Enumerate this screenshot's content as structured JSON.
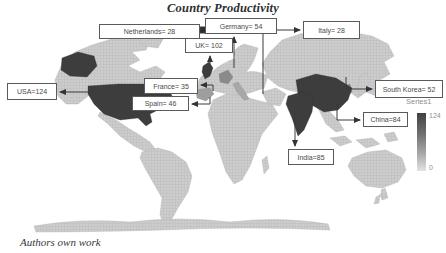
{
  "title": "Country Productivity",
  "caption": "Authors own work",
  "legend": {
    "series": "Series1",
    "max": "124",
    "min": "0"
  },
  "colors": {
    "value_dark": "#3d3d3d",
    "value_medium": "#8a8a8a",
    "land_light": "#cdcdcd",
    "ocean": "#ffffff",
    "box_border": "#5a5a5a",
    "arrow": "#3a3a3a"
  },
  "chart_data": {
    "type": "heatmap",
    "subtype": "world-choropleth-map",
    "title": "Country Productivity",
    "series_name": "Series1",
    "scale_min": 0,
    "scale_max": 124,
    "legend_position": "right",
    "countries": [
      "USA",
      "UK",
      "India",
      "China",
      "Germany",
      "South Korea",
      "Spain",
      "France",
      "Italy",
      "Netherlands"
    ],
    "values": [
      124,
      102,
      85,
      84,
      54,
      52,
      46,
      35,
      28,
      28
    ],
    "callouts": [
      {
        "id": "netherlands",
        "label": "Netherlands= 28",
        "box": [
          99,
          24,
          101,
          15
        ],
        "arrow": [
          [
            207,
            30
          ],
          [
            203,
            30
          ]
        ],
        "end": "square"
      },
      {
        "id": "germany",
        "label": "Germany= 54",
        "box": [
          205,
          18,
          72,
          16
        ],
        "arrow": [
          [
            234,
            68
          ],
          [
            234,
            37
          ]
        ],
        "end": "arrow"
      },
      {
        "id": "italy",
        "label": "Italy= 28",
        "box": [
          303,
          21,
          57,
          18
        ],
        "arrow": [
          [
            263,
            94
          ],
          [
            263,
            30
          ],
          [
            300,
            30
          ]
        ],
        "end": "arrow"
      },
      {
        "id": "uk",
        "label": "UK= 102",
        "box": [
          185,
          38,
          48,
          15
        ],
        "arrow": [
          [
            210,
            67
          ],
          [
            210,
            56
          ]
        ],
        "end": "arrow"
      },
      {
        "id": "usa",
        "label": "USA=124",
        "box": [
          7,
          83,
          50,
          17
        ],
        "arrow": [
          [
            96,
            92
          ],
          [
            60,
            92
          ]
        ],
        "end": "arrow"
      },
      {
        "id": "france",
        "label": "France= 35",
        "box": [
          144,
          78,
          54,
          16
        ],
        "arrow": [
          [
            213,
            91
          ],
          [
            213,
            85
          ],
          [
            201,
            85
          ]
        ],
        "end": "arrow"
      },
      {
        "id": "spain",
        "label": "Spain= 46",
        "box": [
          132,
          96,
          57,
          15
        ],
        "arrow": [
          [
            210,
            97
          ],
          [
            210,
            104
          ],
          [
            192,
            104
          ]
        ],
        "end": "arrow"
      },
      {
        "id": "south-korea",
        "label": "South Korea= 52",
        "box": [
          375,
          80,
          68,
          18
        ],
        "arrow": [
          [
            346,
            77
          ],
          [
            346,
            89
          ],
          [
            372,
            89
          ]
        ],
        "end": "arrow"
      },
      {
        "id": "china",
        "label": "China=84",
        "box": [
          363,
          112,
          45,
          15
        ],
        "arrow": [
          [
            337,
            104
          ],
          [
            337,
            120
          ],
          [
            360,
            120
          ]
        ],
        "end": "arrow"
      },
      {
        "id": "india",
        "label": "India=85",
        "box": [
          288,
          149,
          46,
          16
        ],
        "arrow": [
          [
            295,
            116
          ],
          [
            295,
            146
          ]
        ],
        "end": "arrow"
      }
    ]
  }
}
